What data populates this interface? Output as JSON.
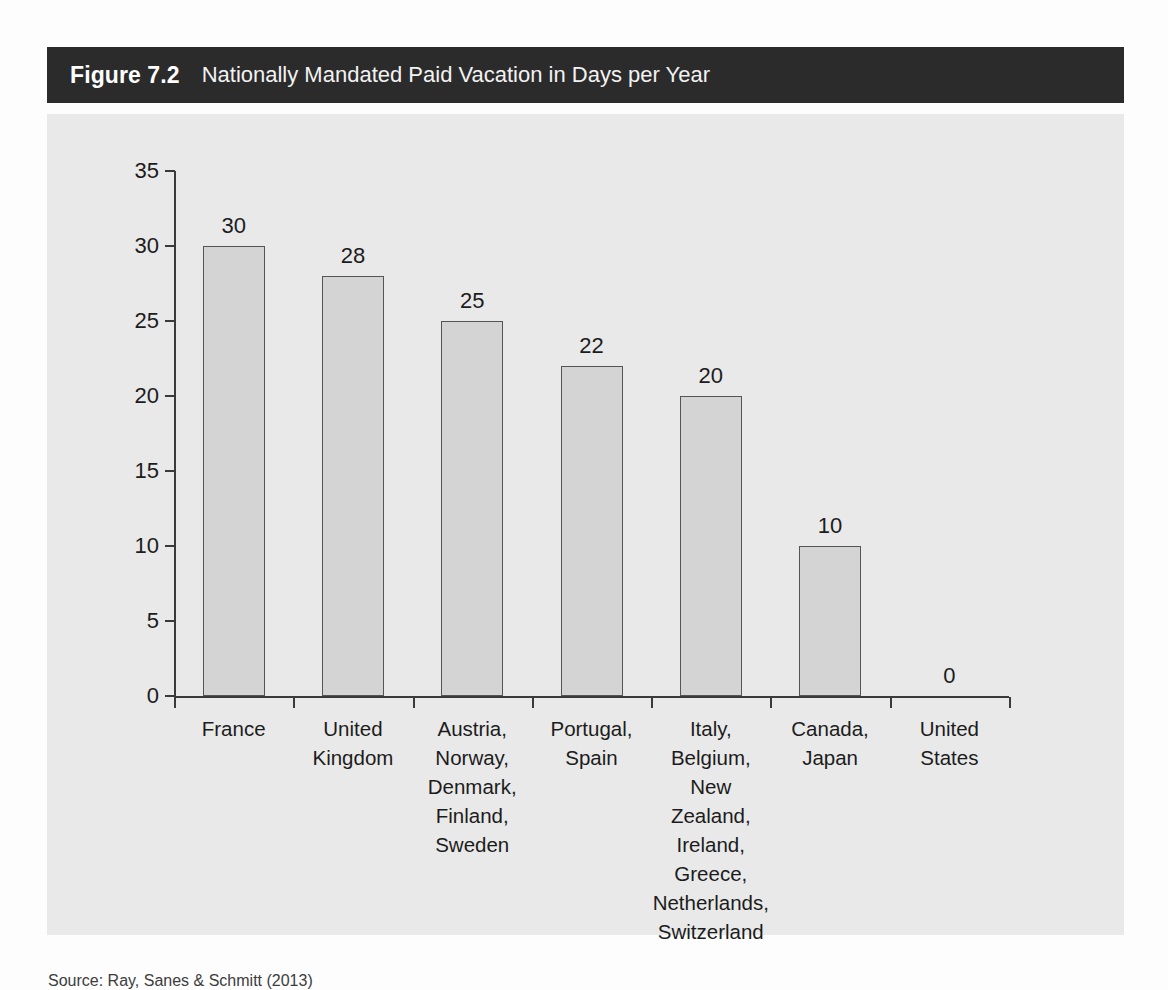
{
  "figure": {
    "number_label": "Figure 7.2",
    "title": "Nationally Mandated Paid Vacation in Days per Year",
    "source_note": "Source: Ray, Sanes & Schmitt (2013)"
  },
  "chart_data": {
    "type": "bar",
    "title": "Nationally Mandated Paid Vacation in Days per Year",
    "xlabel": "",
    "ylabel": "",
    "ylim": [
      0,
      35
    ],
    "yticks": [
      0,
      5,
      10,
      15,
      20,
      25,
      30,
      35
    ],
    "ytick_labels": [
      "0",
      "5",
      "10",
      "15",
      "20",
      "25",
      "30",
      "35"
    ],
    "grid": false,
    "legend": "none",
    "value_labels_shown": true,
    "categories": [
      "France",
      "United Kingdom",
      "Austria, Norway, Denmark, Finland, Sweden",
      "Portugal, Spain",
      "Italy, Belgium, New Zealand, Ireland, Greece, Netherlands, Switzerland",
      "Canada, Japan",
      "United States"
    ],
    "category_lines": [
      [
        "France"
      ],
      [
        "United",
        "Kingdom"
      ],
      [
        "Austria,",
        "Norway,",
        "Denmark,",
        "Finland,",
        "Sweden"
      ],
      [
        "Portugal,",
        "Spain"
      ],
      [
        "Italy,",
        "Belgium,",
        "New Zealand,",
        "Ireland,",
        "Greece,",
        "Netherlands,",
        "Switzerland"
      ],
      [
        "Canada,",
        "Japan"
      ],
      [
        "United",
        "States"
      ]
    ],
    "values": [
      30,
      28,
      25,
      22,
      20,
      10,
      0
    ],
    "value_strings": [
      "30",
      "28",
      "25",
      "22",
      "20",
      "10",
      "0"
    ],
    "bar_fill": "#d4d4d4",
    "bar_edge": "#555555",
    "panel_background": "#e9e9e9",
    "title_bar_background": "#2b2b2b",
    "text_color": "#1c1c1c"
  }
}
